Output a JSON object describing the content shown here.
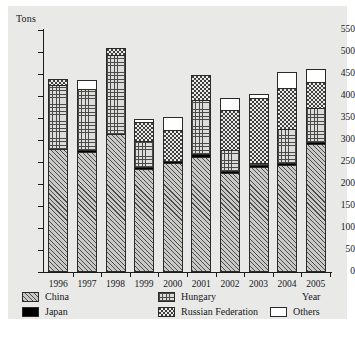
{
  "chart_data": {
    "type": "bar",
    "subtype": "stacked",
    "title": "",
    "xlabel": "Year",
    "ylabel": "Tons",
    "ylim": [
      0,
      550
    ],
    "ytick_step": 50,
    "grid": false,
    "legend_position": "bottom",
    "categories": [
      "1996",
      "1997",
      "1998",
      "1999",
      "2000",
      "2001",
      "2002",
      "2003",
      "2004",
      "2005"
    ],
    "series": [
      {
        "name": "China",
        "pattern": "diagonal-hatch",
        "values": [
          280,
          272,
          313,
          234,
          248,
          262,
          224,
          238,
          243,
          290
        ]
      },
      {
        "name": "Japan",
        "pattern": "solid-black",
        "values": [
          0,
          5,
          0,
          5,
          4,
          7,
          5,
          5,
          5,
          6
        ]
      },
      {
        "name": "Hungary",
        "pattern": "cross-hatch",
        "values": [
          145,
          138,
          180,
          58,
          0,
          122,
          48,
          4,
          78,
          76
        ]
      },
      {
        "name": "Russian Federation",
        "pattern": "dotted",
        "values": [
          13,
          0,
          15,
          43,
          70,
          57,
          91,
          148,
          92,
          60
        ]
      },
      {
        "name": "Others",
        "pattern": "white",
        "values": [
          0,
          22,
          0,
          8,
          31,
          0,
          28,
          10,
          37,
          30
        ]
      }
    ],
    "totals": [
      438,
      437,
      508,
      348,
      353,
      448,
      396,
      405,
      457,
      462
    ],
    "ytick_labels": [
      "0",
      "50",
      "100",
      "150",
      "200",
      "250",
      "300",
      "350",
      "400",
      "450",
      "500",
      "550"
    ]
  },
  "axes": {
    "y_title": "Tons",
    "x_title": "Year"
  },
  "legend": {
    "items": [
      {
        "label": "China"
      },
      {
        "label": "Japan"
      },
      {
        "label": "Hungary"
      },
      {
        "label": "Russian Federation"
      },
      {
        "label": "Others"
      }
    ]
  },
  "colors": {
    "plate_background": "#e9e9e7",
    "axis": "#1b1b1b",
    "text": "#16161a",
    "japan_fill": "#000000",
    "others_fill": "#ffffff"
  }
}
